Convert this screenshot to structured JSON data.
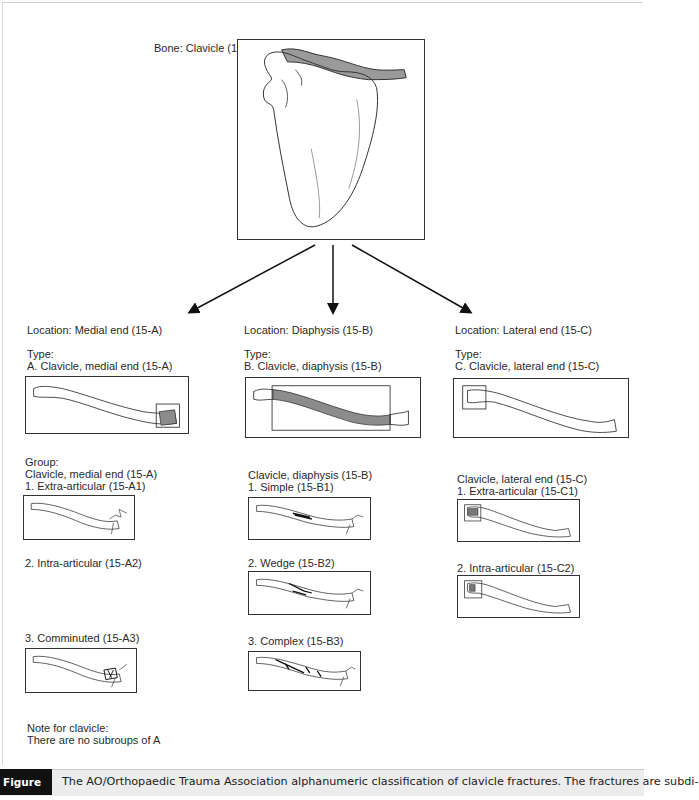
{
  "figure": {
    "bone_label": "Bone: Clavicle (15",
    "columns": [
      {
        "location": "Location: Medial end (15-A)",
        "type_heading": "Type:",
        "type_label": "A. Clavicle, medial end (15-A)",
        "group_heading": "Group:",
        "group_label": "Clavicle, medial end (15-A)",
        "groups": [
          "1. Extra-articular (15-A1)",
          "2. Intra-articular (15-A2)",
          "3. Comminuted (15-A3)"
        ]
      },
      {
        "location": "Location: Diaphysis (15-B)",
        "type_heading": "Type:",
        "type_label": "B. Clavicle, diaphysis (15-B)",
        "group_label": "Clavicle, diaphysis (15-B)",
        "groups": [
          "1. Simple (15-B1)",
          "2. Wedge (15-B2)",
          "3. Complex (15-B3)"
        ]
      },
      {
        "location": "Location: Lateral end (15-C)",
        "type_heading": "Type:",
        "type_label": "C. Clavicle, lateral end (15-C)",
        "group_label": "Clavicle, lateral end (15-C)",
        "groups": [
          "1. Extra-articular (15-C1)",
          "2. Intra-articular (15-C2)"
        ]
      }
    ],
    "note_heading": "Note for clavicle:",
    "note_text": "There are no subroups of A"
  },
  "caption": {
    "tag": "Figure 1",
    "text": "The AO/Orthopaedic Trauma Association alphanumeric classification of clavicle fractures. The fractures are subdi-"
  },
  "colors": {
    "highlight": "#8c8c8c",
    "caption_bg": "#ececec",
    "tag_bg": "#111111"
  }
}
